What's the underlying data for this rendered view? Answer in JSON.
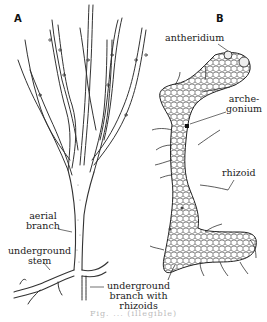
{
  "figure": {
    "panels": [
      {
        "letter": "A"
      },
      {
        "letter": "B"
      }
    ],
    "labels_a": {
      "aerial_branch_1": "aerial",
      "aerial_branch_2": "branch",
      "underground_stem_1": "underground",
      "underground_stem_2": "stem",
      "underground_branch_1": "underground",
      "underground_branch_2": "branch with",
      "underground_branch_3": "rhizoids"
    },
    "labels_b": {
      "antheridium": "antheridium",
      "archegonium_1": "arche-",
      "archegonium_2": "gonium",
      "rhizoid": "rhizoid"
    },
    "caption": "Fig. ...  (illegible)"
  }
}
